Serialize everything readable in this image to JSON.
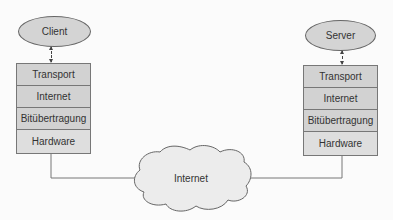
{
  "client": {
    "label": "Client",
    "layers": [
      "Transport",
      "Internet",
      "Bitübertragung",
      "Hardware"
    ]
  },
  "server": {
    "label": "Server",
    "layers": [
      "Transport",
      "Internet",
      "Bitübertragung",
      "Hardware"
    ]
  },
  "network": {
    "label": "Internet"
  },
  "colors": {
    "layer_fill": "#d2d2d2",
    "hardware_fill": "#dedede",
    "ellipse_fill": "#d4d4d4",
    "line": "#777777"
  }
}
